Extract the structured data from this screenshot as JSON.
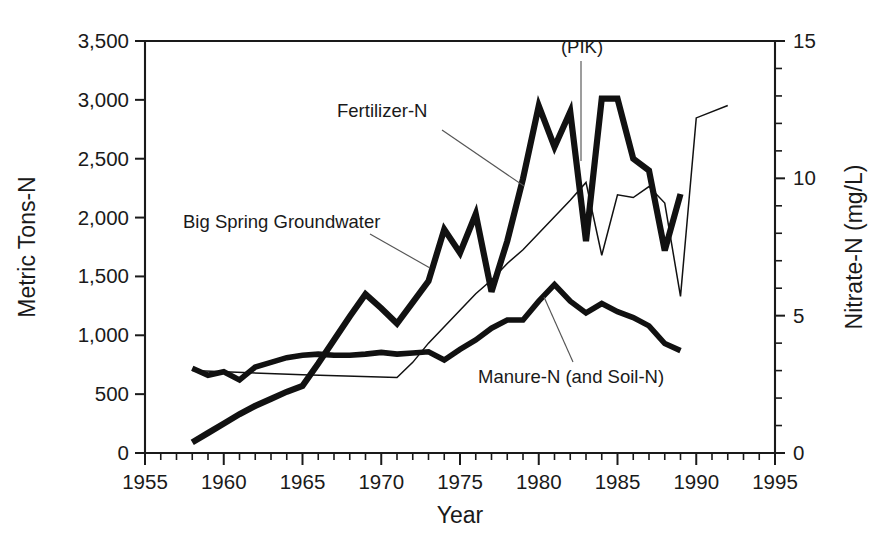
{
  "chart_data": {
    "type": "line",
    "title": "",
    "xlabel": "Year",
    "ylabel": "Metric Tons-N",
    "y2label": "Nitrate-N (mg/L)",
    "xlim": [
      1955,
      1995
    ],
    "ylim": [
      0,
      3500
    ],
    "y2lim": [
      0,
      15
    ],
    "grid": false,
    "legend_position": "inline-labels",
    "x_major_ticks": [
      1955,
      1960,
      1965,
      1970,
      1975,
      1980,
      1985,
      1990,
      1995
    ],
    "x_major_tick_labels": [
      "1955",
      "1960",
      "1965",
      "1970",
      "1975",
      "1980",
      "1985",
      "1990",
      "1995"
    ],
    "x_minor_tick_step": 1,
    "y_major_ticks": [
      0,
      500,
      1000,
      1500,
      2000,
      2500,
      3000,
      3500
    ],
    "y_major_tick_labels": [
      "0",
      "500",
      "1,000",
      "1,500",
      "2,000",
      "2,500",
      "3,000",
      "3,500"
    ],
    "y2_major_ticks": [
      0,
      5,
      10,
      15
    ],
    "y2_major_tick_labels": [
      "0",
      "5",
      "10",
      "15"
    ],
    "y2_minor_tick_step": 1,
    "annotations": [
      {
        "text": "(PIK)",
        "x": 1983,
        "note": "Payment-In-Kind program year marker with vertical leader line down to Fertilizer-N dip"
      }
    ],
    "series": [
      {
        "name": "Fertilizer-N",
        "label": "Fertilizer-N",
        "axis": "left",
        "units": "Metric Tons-N",
        "stroke_style": "thick",
        "x": [
          1958,
          1959,
          1960,
          1961,
          1962,
          1963,
          1964,
          1965,
          1966,
          1967,
          1968,
          1969,
          1970,
          1971,
          1972,
          1973,
          1974,
          1975,
          1976,
          1977,
          1978,
          1979,
          1980,
          1981,
          1982,
          1983,
          1984,
          1985,
          1986,
          1987,
          1988,
          1989
        ],
        "values": [
          90,
          170,
          250,
          330,
          400,
          460,
          520,
          570,
          760,
          960,
          1160,
          1350,
          1230,
          1100,
          1280,
          1460,
          1900,
          1700,
          2030,
          1370,
          1800,
          2330,
          2950,
          2600,
          2900,
          1800,
          3010,
          3010,
          2500,
          2400,
          1720,
          2200
        ]
      },
      {
        "name": "Manure-N (and Soil-N)",
        "label": "Manure-N (and Soil-N)",
        "axis": "left",
        "units": "Metric Tons-N",
        "stroke_style": "medium",
        "x": [
          1958,
          1959,
          1960,
          1961,
          1962,
          1963,
          1964,
          1965,
          1966,
          1967,
          1968,
          1969,
          1970,
          1971,
          1972,
          1973,
          1974,
          1975,
          1976,
          1977,
          1978,
          1979,
          1980,
          1981,
          1982,
          1983,
          1984,
          1985,
          1986,
          1987,
          1988,
          1989
        ],
        "values": [
          720,
          660,
          690,
          620,
          730,
          770,
          810,
          830,
          840,
          830,
          830,
          840,
          855,
          840,
          850,
          860,
          790,
          880,
          960,
          1060,
          1130,
          1130,
          1290,
          1430,
          1290,
          1190,
          1270,
          1200,
          1150,
          1080,
          930,
          870
        ]
      },
      {
        "name": "Big Spring Groundwater",
        "label": "Big Spring Groundwater",
        "axis": "right",
        "units": "Nitrate-N (mg/L)",
        "stroke_style": "thin",
        "x": [
          1958,
          1965,
          1971,
          1972,
          1973,
          1974,
          1975,
          1976,
          1977,
          1978,
          1979,
          1980,
          1981,
          1982,
          1983,
          1984,
          1985,
          1986,
          1987,
          1988,
          1989,
          1990,
          1992
        ],
        "values": [
          3.0,
          2.85,
          2.75,
          3.3,
          4.0,
          4.6,
          5.2,
          5.8,
          6.3,
          6.9,
          7.4,
          8.0,
          8.6,
          9.2,
          9.85,
          7.2,
          9.4,
          9.3,
          9.7,
          9.1,
          5.7,
          12.2,
          12.65
        ]
      }
    ]
  },
  "axes": {
    "left_title": "Metric Tons-N",
    "right_title": "Nitrate-N (mg/L)",
    "bottom_title": "Year"
  },
  "labels": {
    "fertilizer": "Fertilizer-N",
    "groundwater": "Big Spring Groundwater",
    "manure": "Manure-N (and Soil-N)",
    "pik": "(PIK)"
  }
}
